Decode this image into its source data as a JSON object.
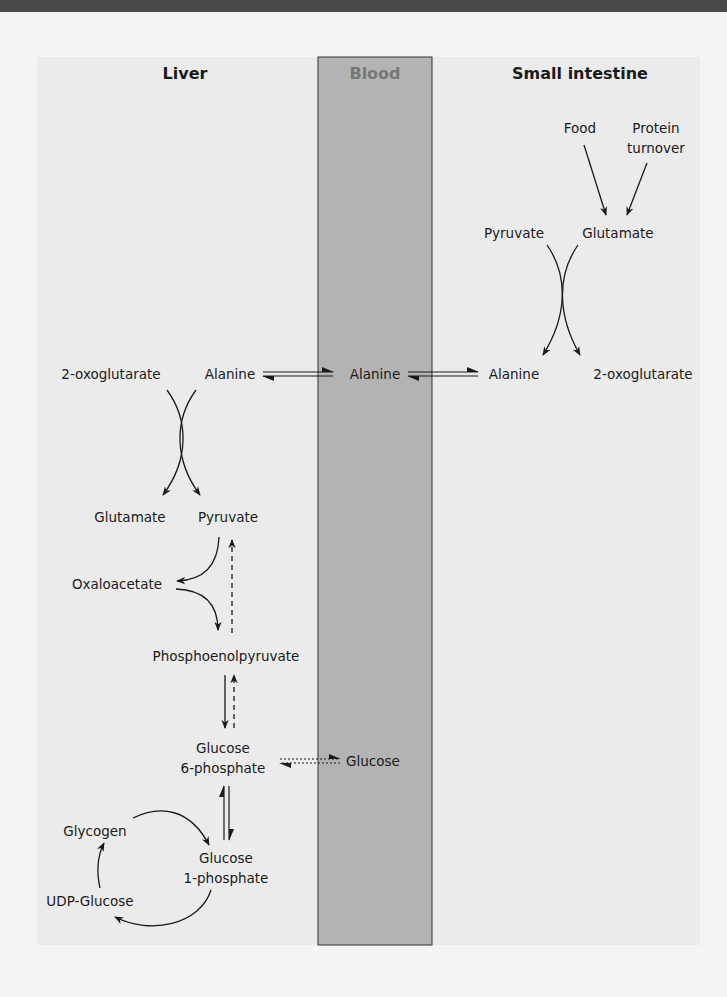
{
  "headers": {
    "liver": "Liver",
    "blood": "Blood",
    "small_intestine": "Small intestine"
  },
  "colors": {
    "blood_fill": "#b3b3b3",
    "blood_header": "#7a7a7a",
    "panel_bg": "#ebebeb"
  },
  "small_intestine": {
    "food": "Food",
    "protein_turnover_1": "Protein",
    "protein_turnover_2": "turnover",
    "pyruvate": "Pyruvate",
    "glutamate": "Glutamate",
    "alanine": "Alanine",
    "oxoglutarate": "2-oxoglutarate"
  },
  "blood": {
    "alanine": "Alanine",
    "glucose": "Glucose"
  },
  "liver": {
    "oxoglutarate": "2-oxoglutarate",
    "alanine": "Alanine",
    "glutamate": "Glutamate",
    "pyruvate": "Pyruvate",
    "oxaloacetate": "Oxaloacetate",
    "pep": "Phosphoenolpyruvate",
    "g6p_1": "Glucose",
    "g6p_2": "6-phosphate",
    "glycogen": "Glycogen",
    "g1p_1": "Glucose",
    "g1p_2": "1-phosphate",
    "udp_glucose": "UDP-Glucose"
  }
}
